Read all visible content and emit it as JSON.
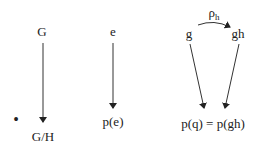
{
  "diagram": {
    "nodes": [
      {
        "id": "G",
        "label": "G"
      },
      {
        "id": "GH",
        "label": "G/H"
      },
      {
        "id": "e",
        "label": "e"
      },
      {
        "id": "pe",
        "label": "p(e)"
      },
      {
        "id": "g",
        "label": "g"
      },
      {
        "id": "gh",
        "label": "gh"
      },
      {
        "id": "pq",
        "label": "p(q) = p(gh)"
      }
    ],
    "edges": [
      {
        "from": "G",
        "to": "GH",
        "label": ""
      },
      {
        "from": "e",
        "to": "pe",
        "label": ""
      },
      {
        "from": "g",
        "to": "gh",
        "label_main": "ρ",
        "label_sub": "h"
      },
      {
        "from": "g",
        "to": "pq",
        "label": ""
      },
      {
        "from": "gh",
        "to": "pq",
        "label": ""
      }
    ],
    "bullet": "•"
  }
}
